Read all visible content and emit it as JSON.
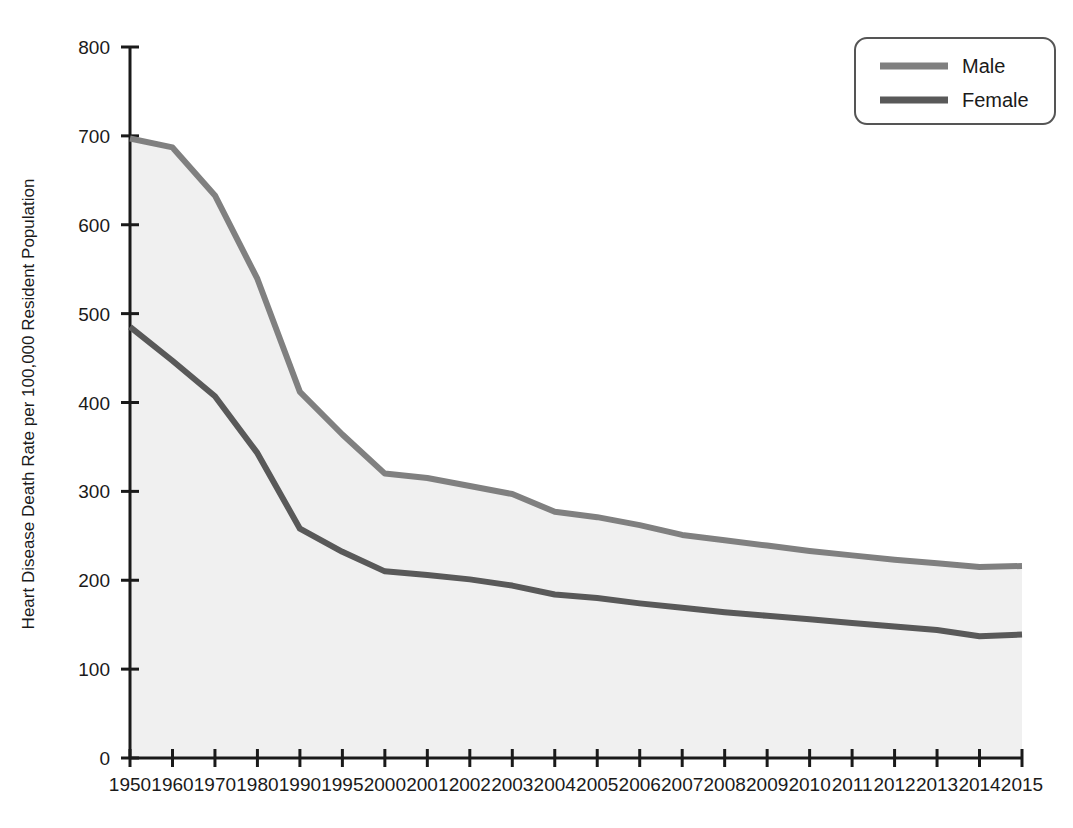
{
  "chart_data": {
    "type": "line",
    "title": "",
    "xlabel": "",
    "ylabel": "Heart Disease Death Rate per 100,000 Resident Population",
    "categories": [
      "1950",
      "1960",
      "1970",
      "1980",
      "1990",
      "1995",
      "2000",
      "2001",
      "2002",
      "2003",
      "2004",
      "2005",
      "2006",
      "2007",
      "2008",
      "2009",
      "2010",
      "2011",
      "2012",
      "2013",
      "2014",
      "2015"
    ],
    "ylim": [
      0,
      800
    ],
    "yticks": [
      0,
      100,
      200,
      300,
      400,
      500,
      600,
      700,
      800
    ],
    "ytick_labels": [
      "0",
      "100",
      "200",
      "300",
      "400",
      "500",
      "600",
      "700",
      "800"
    ],
    "grid": false,
    "legend_position": "top-right",
    "series": [
      {
        "name": "Male",
        "color": "#808080",
        "values": [
          697,
          687,
          633,
          539,
          412,
          364,
          320,
          315,
          306,
          297,
          277,
          271,
          262,
          251,
          245,
          239,
          233,
          228,
          223,
          219,
          215,
          216
        ]
      },
      {
        "name": "Female",
        "color": "#595959",
        "values": [
          485,
          447,
          407,
          343,
          258,
          232,
          210,
          206,
          201,
          194,
          184,
          180,
          174,
          169,
          164,
          160,
          156,
          152,
          148,
          144,
          137,
          139
        ]
      }
    ]
  },
  "legend": {
    "entries": [
      {
        "label": "Male"
      },
      {
        "label": "Female"
      }
    ]
  },
  "axes": {
    "y_title": "Heart Disease Death Rate per 100,000 Resident Population"
  }
}
